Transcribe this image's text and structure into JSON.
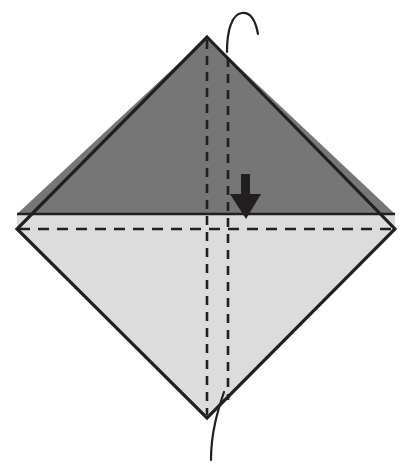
{
  "canvas": {
    "width": 420,
    "height": 474,
    "background": "#ffffff",
    "title": "Origami fold step diagram"
  },
  "colors": {
    "paper_front": "#767676",
    "paper_back": "#dcdcdc",
    "outline": "#231f20",
    "crease_line": "#231f20",
    "arrow_fill": "#231f20",
    "background": "#ffffff"
  },
  "shapes": {
    "diamond": {
      "name": "folded-square-diamond",
      "top": {
        "x": 207,
        "y": 37
      },
      "right": {
        "x": 395,
        "y": 229
      },
      "bottom": {
        "x": 207,
        "y": 418
      },
      "left": {
        "x": 17,
        "y": 229
      },
      "outline_width": 3.2
    },
    "upper_triangle": {
      "name": "dark-upper-flap",
      "fill": "#767676",
      "points": "207,37 395,214 17,214"
    },
    "lower_region": {
      "name": "light-lower-region",
      "fill": "#dcdcdc",
      "points": "17,214 395,214 395,229 207,418 17,229"
    },
    "horizontal_edge": {
      "name": "flap-edge-line",
      "x1": 17,
      "y1": 214,
      "x2": 395,
      "y2": 214,
      "width": 2.4
    }
  },
  "creases": [
    {
      "name": "vertical-crease-left",
      "type": "valley",
      "style": "dashed",
      "x1": 207,
      "y1": 40,
      "x2": 207,
      "y2": 415,
      "dash": "9 7",
      "width": 2.6
    },
    {
      "name": "vertical-crease-right",
      "type": "valley",
      "style": "dashed",
      "x1": 228,
      "y1": 58,
      "x2": 228,
      "y2": 400,
      "dash": "9 7",
      "width": 2.6
    },
    {
      "name": "horizontal-crease-center",
      "type": "valley",
      "style": "dashed",
      "x1": 19,
      "y1": 229,
      "x2": 393,
      "y2": 229,
      "dash": "11 8",
      "width": 2.6
    }
  ],
  "curves": [
    {
      "name": "top-hook-curve",
      "description": "thin curved line rising from apex and hooking to the right",
      "path": "M 227,52 C 227,30 232,14 242,13 C 252,12 256,23 258,34",
      "width": 2.2
    },
    {
      "name": "bottom-tail-curve",
      "description": "thin curved line descending below the bottom vertex",
      "path": "M 224,392 C 218,410 211,432 211,460",
      "width": 2.2
    }
  ],
  "arrow": {
    "name": "fold-down-arrow",
    "direction": "down",
    "shaft": {
      "x": 241,
      "y_top": 174,
      "width": 9,
      "y_bottom": 197
    },
    "head": {
      "left_x": 230,
      "right_x": 261,
      "y_top": 194,
      "tip_x": 246,
      "tip_y": 219
    },
    "fill": "#231f20"
  },
  "labels": {
    "figure_caption": "",
    "step_number": ""
  }
}
